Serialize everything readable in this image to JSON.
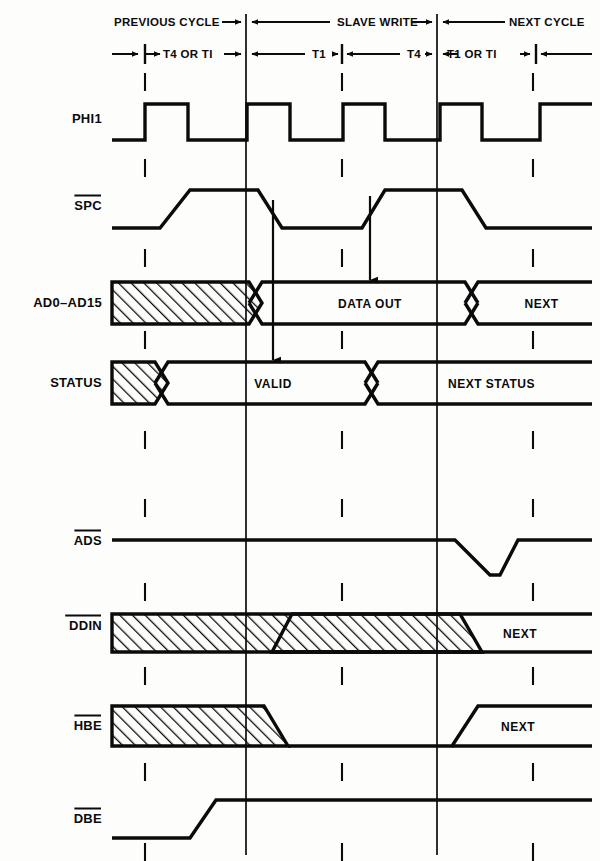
{
  "diagram": {
    "background_color": "#fdfdfc",
    "ink_color": "#0b0b0b"
  },
  "header": {
    "cycles": [
      {
        "label": "PREVIOUS CYCLE"
      },
      {
        "label": "SLAVE WRITE"
      },
      {
        "label": "NEXT CYCLE"
      }
    ],
    "states": [
      {
        "label": "T4 OR TI"
      },
      {
        "label": "T1"
      },
      {
        "label": "T4"
      },
      {
        "label": "T1 OR TI"
      }
    ]
  },
  "signals": [
    {
      "name": "PHI1",
      "overbar": false,
      "y": 118
    },
    {
      "name": "SPC",
      "overbar": true,
      "y": 205
    },
    {
      "name": "AD0–AD15",
      "overbar": false,
      "y": 302
    },
    {
      "name": "STATUS",
      "overbar": false,
      "y": 382
    },
    {
      "name": "ADS",
      "overbar": true,
      "y": 540
    },
    {
      "name": "DDIN",
      "overbar": true,
      "y": 625
    },
    {
      "name": "HBE",
      "overbar": true,
      "y": 725
    },
    {
      "name": "DBE",
      "overbar": true,
      "y": 818
    }
  ],
  "bus_labels": {
    "data_out": "DATA OUT",
    "next": "NEXT",
    "valid": "VALID",
    "next_status": "NEXT STATUS",
    "ddin_next": "NEXT",
    "hbe_next": "NEXT"
  },
  "chart_data": {
    "type": "timing",
    "x_axis_px": {
      "left": 112,
      "right": 592
    },
    "boundaries_px": [
      246,
      437
    ],
    "minor_ticks_px": [
      342,
      536
    ],
    "waveforms": [
      {
        "signal": "PHI1",
        "kind": "clock",
        "pulses_px": [
          [
            145,
            188
          ],
          [
            247,
            290
          ],
          [
            343,
            385
          ],
          [
            440,
            482
          ]
        ],
        "high_y": 104,
        "low_y": 140
      },
      {
        "signal": "SPC",
        "kind": "level",
        "segments": [
          {
            "level": "low",
            "from": 112,
            "to": 160
          },
          {
            "level": "rise",
            "from": 160,
            "to": 190
          },
          {
            "level": "high",
            "from": 190,
            "to": 258
          },
          {
            "level": "fall",
            "from": 258,
            "to": 282
          },
          {
            "level": "low",
            "from": 282,
            "to": 362
          },
          {
            "level": "rise",
            "from": 362,
            "to": 385
          },
          {
            "level": "high",
            "from": 385,
            "to": 462
          },
          {
            "level": "fall",
            "from": 462,
            "to": 486
          },
          {
            "level": "low",
            "from": 486,
            "to": 592
          }
        ],
        "high_y": 190,
        "low_y": 228
      },
      {
        "signal": "AD0–AD15",
        "kind": "bus",
        "cells": [
          {
            "state": "hatched",
            "from": 112,
            "to": 262,
            "label": ""
          },
          {
            "state": "valid",
            "from": 262,
            "to": 478,
            "label": "DATA OUT"
          },
          {
            "state": "valid",
            "from": 478,
            "to": 592,
            "label": "NEXT"
          }
        ],
        "top_y": 282,
        "bot_y": 324
      },
      {
        "signal": "STATUS",
        "kind": "bus",
        "cells": [
          {
            "state": "hatched",
            "from": 112,
            "to": 168,
            "label": ""
          },
          {
            "state": "valid",
            "from": 168,
            "to": 378,
            "label": "VALID"
          },
          {
            "state": "valid",
            "from": 378,
            "to": 592,
            "label": "NEXT STATUS"
          }
        ],
        "top_y": 362,
        "bot_y": 404
      },
      {
        "signal": "ADS",
        "kind": "pulse-low",
        "high_y": 540,
        "low_y": 575,
        "dip_px": [
          455,
          490,
          500,
          518
        ]
      },
      {
        "signal": "DDIN",
        "kind": "bus-hatch-then-level",
        "hatch": [
          112,
          272
        ],
        "rise": [
          272,
          292
        ],
        "high_y": 614,
        "low_y": 652,
        "fall": [
          460,
          482
        ],
        "next_label_x": 520
      },
      {
        "signal": "HBE",
        "kind": "bus-hatch-then-level",
        "hatch": [
          112,
          264
        ],
        "fall": [
          264,
          288
        ],
        "high_y": 706,
        "low_y": 746,
        "rise": [
          452,
          478
        ],
        "next_label_x": 518
      },
      {
        "signal": "DBE",
        "kind": "level",
        "segments": [
          {
            "level": "low",
            "from": 112,
            "to": 190
          },
          {
            "level": "rise",
            "from": 190,
            "to": 216
          },
          {
            "level": "high",
            "from": 216,
            "to": 592
          }
        ],
        "high_y": 800,
        "low_y": 838
      }
    ],
    "arrows": [
      {
        "from_x": 273,
        "from_y": 200,
        "to_x": 273,
        "to_y": 360
      },
      {
        "from_x": 370,
        "from_y": 196,
        "to_x": 370,
        "to_y": 280
      }
    ],
    "dashed_tick_columns_px": [
      145,
      342,
      533
    ]
  }
}
